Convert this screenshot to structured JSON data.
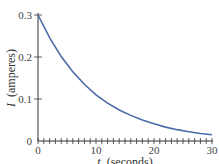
{
  "chart_data": {
    "type": "line",
    "title": "",
    "xlabel_var": "t",
    "xlabel_unit": "(seconds)",
    "ylabel_var": "I",
    "ylabel_unit": "(amperes)",
    "xlim": [
      0,
      30
    ],
    "ylim": [
      0,
      0.3
    ],
    "x_ticks": [
      "0",
      "10",
      "20",
      "30"
    ],
    "y_ticks": [
      "0",
      "0.1",
      "0.2",
      "0.3"
    ],
    "x_minor_tick_step": 1,
    "grid": false,
    "legend": "none",
    "series": [
      {
        "name": "I(t)",
        "color": "#4a6aa8",
        "x": [
          0,
          2,
          4,
          6,
          8,
          10,
          12,
          14,
          16,
          18,
          20,
          22,
          24,
          26,
          28,
          30
        ],
        "values": [
          0.3,
          0.246,
          0.201,
          0.165,
          0.135,
          0.11,
          0.09,
          0.074,
          0.061,
          0.05,
          0.041,
          0.033,
          0.027,
          0.022,
          0.018,
          0.015
        ]
      }
    ]
  }
}
